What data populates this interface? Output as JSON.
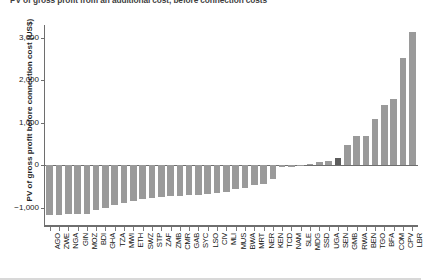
{
  "chart_data": {
    "type": "bar",
    "title": "PV of gross profit from an additional cost, before connection costs",
    "subtitle": "",
    "xlabel": "",
    "ylabel": "PV of gross profit before connection cost (US$)",
    "ylim": [
      -1400,
      3300
    ],
    "yticks": [
      -1000,
      0,
      1000,
      2000,
      3000
    ],
    "ytick_labels": [
      "−1,000",
      "0",
      "1,000",
      "2,000",
      "3,000"
    ],
    "grid": false,
    "legend": "none",
    "bar_color": "#9a9a9a",
    "highlight_color": "#5d5d5d",
    "highlighted_category": "SEN",
    "categories": [
      "AGO",
      "ZWE",
      "NGA",
      "GIN",
      "MOZ",
      "BDI",
      "GHA",
      "TZA",
      "MWI",
      "ETH",
      "SWZ",
      "STP",
      "ZAF",
      "ZMB",
      "CMR",
      "GAB",
      "SYC",
      "LSO",
      "CIV",
      "MLI",
      "MUS",
      "BWA",
      "MRT",
      "NER",
      "KEN",
      "TCD",
      "NAM",
      "SLE",
      "MDG",
      "SSD",
      "UGA",
      "SEN",
      "GMB",
      "RWA",
      "BEN",
      "TGO",
      "BFA",
      "COM",
      "CPV",
      "LBR"
    ],
    "values": [
      -1160,
      -1155,
      -1150,
      -1145,
      -1140,
      -1055,
      -1000,
      -930,
      -880,
      -840,
      -800,
      -770,
      -750,
      -730,
      -715,
      -700,
      -690,
      -670,
      -650,
      -620,
      -560,
      -520,
      -460,
      -440,
      -310,
      -40,
      -30,
      20,
      35,
      70,
      110,
      180,
      480,
      690,
      700,
      1090,
      1410,
      1570,
      2520,
      3130
    ]
  }
}
